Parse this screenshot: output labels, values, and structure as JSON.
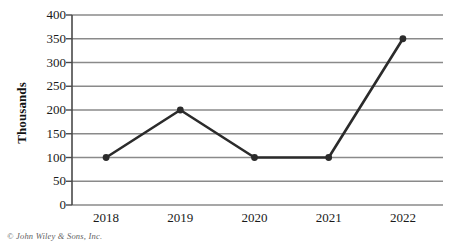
{
  "chart_data": {
    "type": "line",
    "title": "",
    "xlabel": "",
    "ylabel": "Thousands",
    "categories": [
      "2018",
      "2019",
      "2020",
      "2021",
      "2022"
    ],
    "values": [
      100,
      200,
      100,
      100,
      350
    ],
    "series": [
      {
        "name": "Thousands",
        "values": [
          100,
          200,
          100,
          100,
          350
        ]
      }
    ],
    "ylim": [
      0,
      400
    ],
    "yticks": [
      0,
      50,
      100,
      150,
      200,
      250,
      300,
      350,
      400
    ],
    "ytick_labels": [
      "0",
      "50",
      "100",
      "150",
      "200",
      "250",
      "300",
      "350",
      "400"
    ],
    "grid": "horizontal",
    "legend": "none",
    "marker": "filled-circle",
    "line_color": "#2b2b2b",
    "grid_color": "#8a8a8a",
    "axis_color": "#4a4a4a",
    "background": "#ffffff"
  },
  "footer": {
    "copyright": "© John Wiley & Sons, Inc."
  }
}
